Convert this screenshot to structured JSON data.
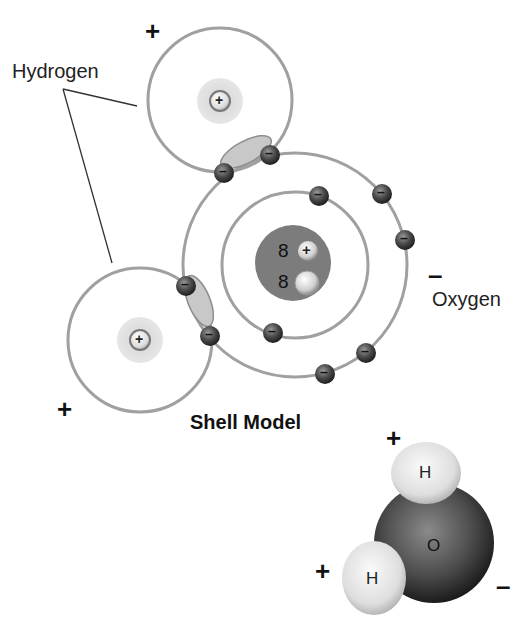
{
  "diagram": {
    "title": "Shell Model",
    "labels": {
      "hydrogen": "Hydrogen",
      "oxygen": "Oxygen"
    },
    "charges": {
      "h_top_shell": "+",
      "h_left_shell": "+",
      "oxygen_shell": "–",
      "h_top_spacefill": "+",
      "h_left_spacefill": "+",
      "oxygen_spacefill": "–"
    },
    "nucleus": {
      "protons": "8",
      "neutrons": "8",
      "proton_symbol": "+",
      "hydrogen_nucleus_symbol": "+"
    },
    "electron_symbol": "–",
    "space_filling_model": {
      "hydrogen_label": "H",
      "oxygen_label": "O"
    },
    "colors": {
      "shell_line": "#9a9a9a",
      "shared_pair": "#c8c8c8",
      "oxygen_nucleus": "#7a7a7a",
      "electron": "#3e3e3e",
      "hydrogen_nucleus_glow": "#d9d9d9",
      "oxygen_sphere": "#4a4a4a",
      "hydrogen_sphere": "#e6e6e6"
    }
  }
}
